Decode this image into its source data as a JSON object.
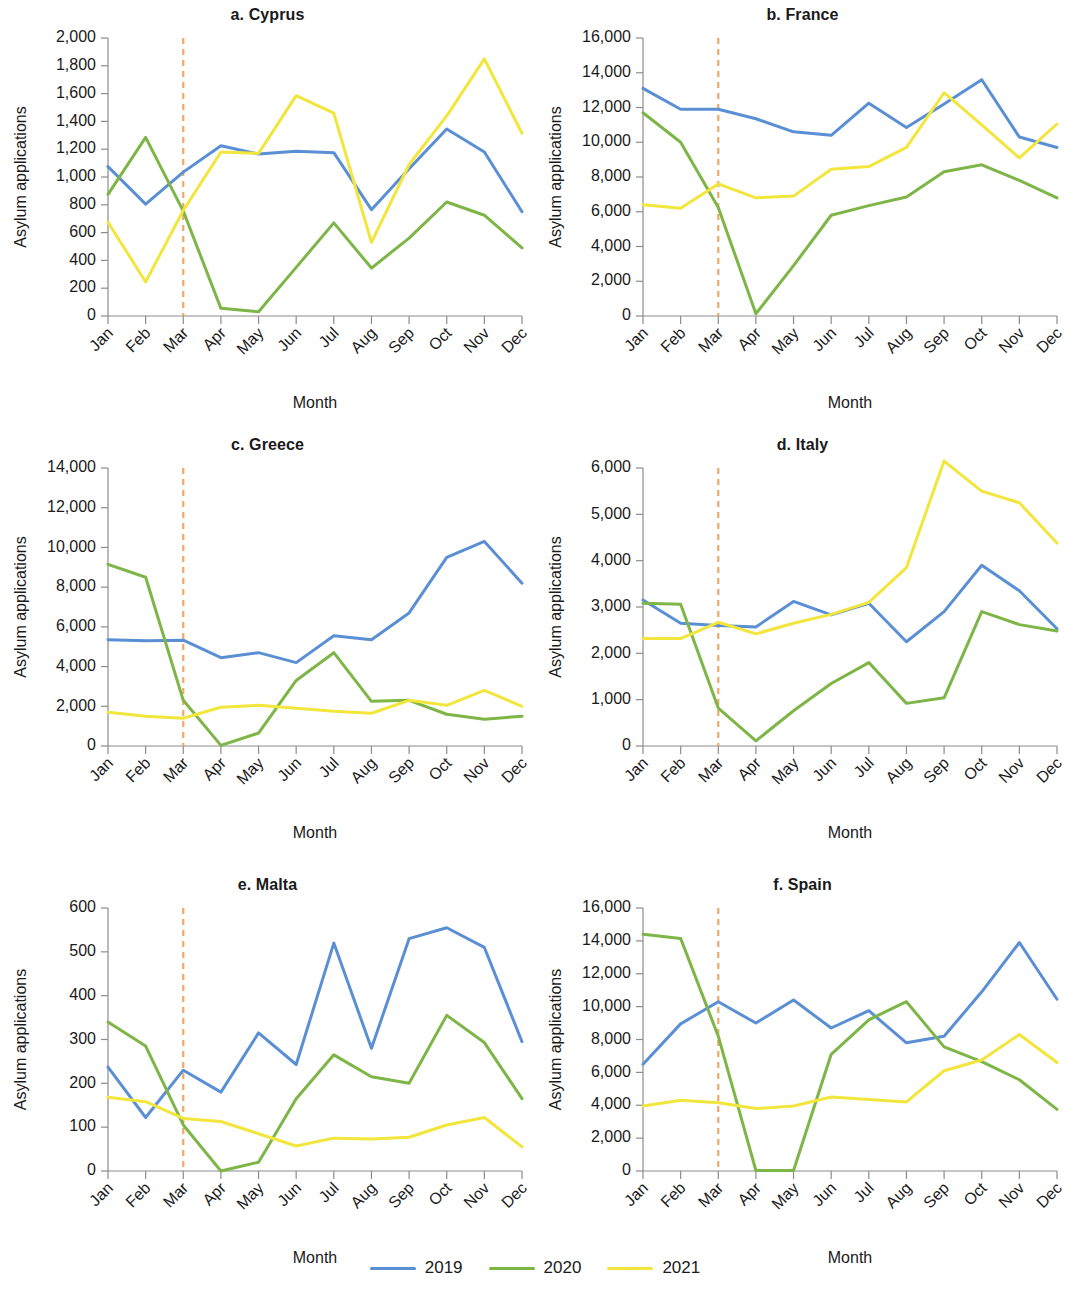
{
  "figure": {
    "background": "#ffffff",
    "colors": {
      "2019": "#5B8FD4",
      "2020": "#7DB547",
      "2021": "#F2E63C",
      "marker": "#F0A868",
      "axis": "#8c8c8c",
      "text": "#1a1a1a"
    },
    "marker_month": "Mar",
    "legend": {
      "items": [
        {
          "label": "2019",
          "color": "#5B8FD4",
          "swatch": "line-swatch"
        },
        {
          "label": "2020",
          "color": "#7DB547",
          "swatch": "line-swatch"
        },
        {
          "label": "2021",
          "color": "#F2E63C",
          "swatch": "line-swatch"
        }
      ]
    }
  },
  "chart_data": [
    {
      "type": "line",
      "panel": "a",
      "title": "a. Cyprus",
      "xlabel": "Month",
      "ylabel": "Asylum applications",
      "categories": [
        "Jan",
        "Feb",
        "Mar",
        "Apr",
        "May",
        "Jun",
        "Jul",
        "Aug",
        "Sep",
        "Oct",
        "Nov",
        "Dec"
      ],
      "ylim": [
        0,
        2000
      ],
      "yticks": [
        0,
        200,
        400,
        600,
        800,
        1000,
        1200,
        1400,
        1600,
        1800,
        2000
      ],
      "ytick_labels": [
        "0",
        "200",
        "400",
        "600",
        "800",
        "1,000",
        "1,200",
        "1,400",
        "1,600",
        "1,800",
        "2,000"
      ],
      "grid": false,
      "legend_position": "bottom-figure",
      "annotation": {
        "type": "vline",
        "at": "Mar",
        "style": "dashed",
        "color": "#F0A868"
      },
      "series": [
        {
          "name": "2019",
          "color": "#5B8FD4",
          "values": [
            1075,
            805,
            1035,
            1225,
            1165,
            1185,
            1175,
            765,
            1060,
            1345,
            1180,
            750
          ]
        },
        {
          "name": "2020",
          "color": "#7DB547",
          "values": [
            875,
            1285,
            755,
            55,
            30,
            350,
            670,
            345,
            560,
            820,
            725,
            490
          ]
        },
        {
          "name": "2021",
          "color": "#F2E63C",
          "values": [
            675,
            245,
            760,
            1180,
            1170,
            1585,
            1460,
            530,
            1090,
            1440,
            1850,
            1315
          ]
        }
      ]
    },
    {
      "type": "line",
      "panel": "b",
      "title": "b. France",
      "xlabel": "Month",
      "ylabel": "Asylum applications",
      "categories": [
        "Jan",
        "Feb",
        "Mar",
        "Apr",
        "May",
        "Jun",
        "Jul",
        "Aug",
        "Sep",
        "Oct",
        "Nov",
        "Dec"
      ],
      "ylim": [
        0,
        16000
      ],
      "yticks": [
        0,
        2000,
        4000,
        6000,
        8000,
        10000,
        12000,
        14000,
        16000
      ],
      "ytick_labels": [
        "0",
        "2,000",
        "4,000",
        "6,000",
        "8,000",
        "10,000",
        "12,000",
        "14,000",
        "16,000"
      ],
      "grid": false,
      "legend_position": "bottom-figure",
      "annotation": {
        "type": "vline",
        "at": "Mar",
        "style": "dashed",
        "color": "#F0A868"
      },
      "series": [
        {
          "name": "2019",
          "color": "#5B8FD4",
          "values": [
            13100,
            11900,
            11900,
            11350,
            10600,
            10400,
            12250,
            10850,
            12200,
            13600,
            10300,
            9700
          ]
        },
        {
          "name": "2020",
          "color": "#7DB547",
          "values": [
            11700,
            10000,
            6250,
            130,
            2900,
            5800,
            6350,
            6850,
            8300,
            8700,
            7800,
            6800
          ]
        },
        {
          "name": "2021",
          "color": "#F2E63C",
          "values": [
            6400,
            6200,
            7600,
            6800,
            6900,
            8450,
            8600,
            9700,
            12850,
            11000,
            9100,
            11050
          ]
        }
      ]
    },
    {
      "type": "line",
      "panel": "c",
      "title": "c. Greece",
      "xlabel": "Month",
      "ylabel": "Asylum applications",
      "categories": [
        "Jan",
        "Feb",
        "Mar",
        "Apr",
        "May",
        "Jun",
        "Jul",
        "Aug",
        "Sep",
        "Oct",
        "Nov",
        "Dec"
      ],
      "ylim": [
        0,
        14000
      ],
      "yticks": [
        0,
        2000,
        4000,
        6000,
        8000,
        10000,
        12000,
        14000
      ],
      "ytick_labels": [
        "0",
        "2,000",
        "4,000",
        "6,000",
        "8,000",
        "10,000",
        "12,000",
        "14,000"
      ],
      "grid": false,
      "legend_position": "bottom-figure",
      "annotation": {
        "type": "vline",
        "at": "Mar",
        "style": "dashed",
        "color": "#F0A868"
      },
      "series": [
        {
          "name": "2019",
          "color": "#5B8FD4",
          "values": [
            5350,
            5300,
            5330,
            4450,
            4700,
            4200,
            5550,
            5350,
            6700,
            9500,
            10300,
            8200
          ]
        },
        {
          "name": "2020",
          "color": "#7DB547",
          "values": [
            9150,
            8500,
            2300,
            30,
            650,
            3300,
            4700,
            2250,
            2300,
            1600,
            1350,
            1500
          ]
        },
        {
          "name": "2021",
          "color": "#F2E63C",
          "values": [
            1700,
            1500,
            1400,
            1950,
            2050,
            1900,
            1750,
            1650,
            2300,
            2050,
            2800,
            2000
          ]
        }
      ]
    },
    {
      "type": "line",
      "panel": "d",
      "title": "d. Italy",
      "xlabel": "Month",
      "ylabel": "Asylum applications",
      "categories": [
        "Jan",
        "Feb",
        "Mar",
        "Apr",
        "May",
        "Jun",
        "Jul",
        "Aug",
        "Sep",
        "Oct",
        "Nov",
        "Dec"
      ],
      "ylim": [
        0,
        6000
      ],
      "yticks": [
        0,
        1000,
        2000,
        3000,
        4000,
        5000,
        6000
      ],
      "ytick_labels": [
        "0",
        "1,000",
        "2,000",
        "3,000",
        "4,000",
        "5,000",
        "6,000"
      ],
      "grid": false,
      "legend_position": "bottom-figure",
      "annotation": {
        "type": "vline",
        "at": "Mar",
        "style": "dashed",
        "color": "#F0A868"
      },
      "series": [
        {
          "name": "2019",
          "color": "#5B8FD4",
          "values": [
            3150,
            2650,
            2600,
            2570,
            3120,
            2830,
            3080,
            2250,
            2900,
            3900,
            3350,
            2530
          ]
        },
        {
          "name": "2020",
          "color": "#7DB547",
          "values": [
            3080,
            3060,
            820,
            110,
            760,
            1350,
            1800,
            920,
            1040,
            2900,
            2620,
            2480
          ]
        },
        {
          "name": "2021",
          "color": "#F2E63C",
          "values": [
            2320,
            2320,
            2670,
            2420,
            2650,
            2840,
            3100,
            3850,
            6150,
            5500,
            5250,
            4380
          ]
        }
      ]
    },
    {
      "type": "line",
      "panel": "e",
      "title": "e. Malta",
      "xlabel": "Month",
      "ylabel": "Asylum applications",
      "categories": [
        "Jan",
        "Feb",
        "Mar",
        "Apr",
        "May",
        "Jun",
        "Jul",
        "Aug",
        "Sep",
        "Oct",
        "Nov",
        "Dec"
      ],
      "ylim": [
        0,
        600
      ],
      "yticks": [
        0,
        100,
        200,
        300,
        400,
        500,
        600
      ],
      "ytick_labels": [
        "0",
        "100",
        "200",
        "300",
        "400",
        "500",
        "600"
      ],
      "grid": false,
      "legend_position": "bottom-figure",
      "annotation": {
        "type": "vline",
        "at": "Mar",
        "style": "dashed",
        "color": "#F0A868"
      },
      "series": [
        {
          "name": "2019",
          "color": "#5B8FD4",
          "values": [
            237,
            122,
            230,
            180,
            315,
            243,
            520,
            280,
            530,
            555,
            510,
            295
          ]
        },
        {
          "name": "2020",
          "color": "#7DB547",
          "values": [
            340,
            285,
            105,
            0,
            20,
            165,
            265,
            215,
            200,
            355,
            293,
            165
          ]
        },
        {
          "name": "2021",
          "color": "#F2E63C",
          "values": [
            168,
            158,
            120,
            113,
            85,
            57,
            75,
            73,
            77,
            105,
            122,
            55
          ]
        }
      ]
    },
    {
      "type": "line",
      "panel": "f",
      "title": "f. Spain",
      "xlabel": "Month",
      "ylabel": "Asylum applications",
      "categories": [
        "Jan",
        "Feb",
        "Mar",
        "Apr",
        "May",
        "Jun",
        "Jul",
        "Aug",
        "Sep",
        "Oct",
        "Nov",
        "Dec"
      ],
      "ylim": [
        0,
        16000
      ],
      "yticks": [
        0,
        2000,
        4000,
        6000,
        8000,
        10000,
        12000,
        14000,
        16000
      ],
      "ytick_labels": [
        "0",
        "2,000",
        "4,000",
        "6,000",
        "8,000",
        "10,000",
        "12,000",
        "14,000",
        "16,000"
      ],
      "grid": false,
      "legend_position": "bottom-figure",
      "annotation": {
        "type": "vline",
        "at": "Mar",
        "style": "dashed",
        "color": "#F0A868"
      },
      "series": [
        {
          "name": "2019",
          "color": "#5B8FD4",
          "values": [
            6500,
            8950,
            10300,
            9000,
            10400,
            8700,
            9750,
            7800,
            8200,
            10900,
            13900,
            10450
          ]
        },
        {
          "name": "2020",
          "color": "#7DB547",
          "values": [
            14400,
            14150,
            8200,
            30,
            30,
            7100,
            9200,
            10300,
            7550,
            6650,
            5550,
            3750
          ]
        },
        {
          "name": "2021",
          "color": "#F2E63C",
          "values": [
            3950,
            4300,
            4150,
            3800,
            3950,
            4500,
            4350,
            4200,
            6100,
            6750,
            8300,
            6600
          ]
        }
      ]
    }
  ]
}
